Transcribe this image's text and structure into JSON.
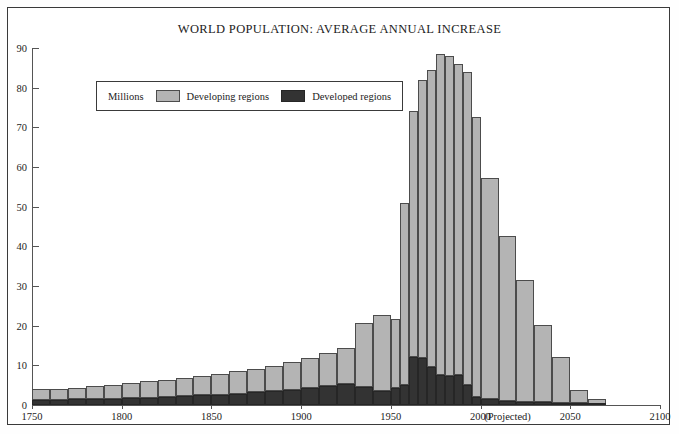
{
  "chart_data": {
    "type": "bar",
    "stacked": true,
    "title": "WORLD POPULATION: AVERAGE ANNUAL INCREASE",
    "xlabel": "",
    "ylabel": "Millions",
    "ylim": [
      0,
      90
    ],
    "yticks": [
      0,
      10,
      20,
      30,
      40,
      50,
      60,
      70,
      80,
      90
    ],
    "xlim": [
      1750,
      2100
    ],
    "xticks": [
      1750,
      1800,
      1850,
      1900,
      1950,
      2000,
      2050,
      2100
    ],
    "xtick_labels": [
      "1750",
      "1800",
      "1850",
      "1900",
      "1950",
      "2000",
      "2050",
      "2100"
    ],
    "annotations": [
      {
        "text": "(Projected)",
        "x": 2015
      }
    ],
    "grid": false,
    "legend_position": "upper-left",
    "legend_title": "Millions",
    "series": [
      {
        "name": "Developing regions",
        "color": "#b4b4b4",
        "values": [
          2.7,
          2.7,
          3.0,
          3.2,
          3.5,
          3.8,
          4.2,
          4.3,
          4.6,
          5.0,
          5.3,
          5.6,
          6.0,
          6.4,
          6.9,
          7.4,
          8.2,
          9.0,
          16.2,
          19.0,
          17.5,
          46.0,
          62.0,
          70.2,
          75.0,
          81.0,
          80.5,
          78.5,
          79.0,
          70.5,
          55.8,
          41.5,
          30.6,
          19.6,
          11.5,
          3.5,
          1.2
        ]
      },
      {
        "name": "Developed regions",
        "color": "#333333",
        "values": [
          1.3,
          1.3,
          1.4,
          1.5,
          1.6,
          1.7,
          1.8,
          2.0,
          2.2,
          2.4,
          2.6,
          2.9,
          3.2,
          3.5,
          3.9,
          4.4,
          4.9,
          5.4,
          4.5,
          3.6,
          4.3,
          5.0,
          12.0,
          11.8,
          9.5,
          7.5,
          7.4,
          7.5,
          5.0,
          2.0,
          1.4,
          1.0,
          0.8,
          0.7,
          0.5,
          0.4,
          0.3
        ]
      }
    ],
    "bins": [
      {
        "start": 1750,
        "end": 1760
      },
      {
        "start": 1760,
        "end": 1770
      },
      {
        "start": 1770,
        "end": 1780
      },
      {
        "start": 1780,
        "end": 1790
      },
      {
        "start": 1790,
        "end": 1800
      },
      {
        "start": 1800,
        "end": 1810
      },
      {
        "start": 1810,
        "end": 1820
      },
      {
        "start": 1820,
        "end": 1830
      },
      {
        "start": 1830,
        "end": 1840
      },
      {
        "start": 1840,
        "end": 1850
      },
      {
        "start": 1850,
        "end": 1860
      },
      {
        "start": 1860,
        "end": 1870
      },
      {
        "start": 1870,
        "end": 1880
      },
      {
        "start": 1880,
        "end": 1890
      },
      {
        "start": 1890,
        "end": 1900
      },
      {
        "start": 1900,
        "end": 1910
      },
      {
        "start": 1910,
        "end": 1920
      },
      {
        "start": 1920,
        "end": 1930
      },
      {
        "start": 1930,
        "end": 1940
      },
      {
        "start": 1940,
        "end": 1950
      },
      {
        "start": 1950,
        "end": 1955
      },
      {
        "start": 1955,
        "end": 1960
      },
      {
        "start": 1960,
        "end": 1965
      },
      {
        "start": 1965,
        "end": 1970
      },
      {
        "start": 1970,
        "end": 1975
      },
      {
        "start": 1975,
        "end": 1980
      },
      {
        "start": 1980,
        "end": 1985
      },
      {
        "start": 1985,
        "end": 1990
      },
      {
        "start": 1990,
        "end": 1995
      },
      {
        "start": 1995,
        "end": 2000
      },
      {
        "start": 2000,
        "end": 2010
      },
      {
        "start": 2010,
        "end": 2020
      },
      {
        "start": 2020,
        "end": 2030
      },
      {
        "start": 2030,
        "end": 2040
      },
      {
        "start": 2040,
        "end": 2050
      },
      {
        "start": 2050,
        "end": 2060
      },
      {
        "start": 2060,
        "end": 2070
      }
    ]
  },
  "legend": {
    "title": "Millions",
    "items": [
      {
        "label": "Developing regions",
        "swatch": "dev"
      },
      {
        "label": "Developed regions",
        "swatch": "ped"
      }
    ]
  },
  "projection_note": "(Projected)"
}
